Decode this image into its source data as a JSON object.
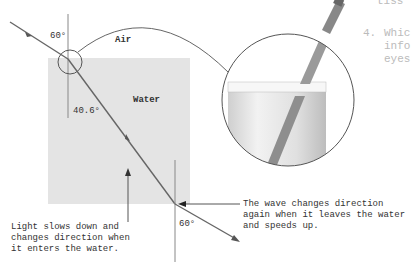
{
  "diagram": {
    "media": {
      "air_label": "Air",
      "water_label": "Water"
    },
    "angles": {
      "incident": "60°",
      "refracted": "40.6°",
      "exit": "60°"
    },
    "annotations": {
      "enter": "Light slows down and\nchanges direction when\nit enters the water.",
      "exit": "The wave changes direction\nagain when it leaves the water\nand speeds up."
    },
    "inset": {
      "description": "pencil-in-glass-of-water"
    },
    "colors": {
      "water_fill": "#e4e4e4",
      "ray": "#666666",
      "line": "#888888"
    }
  },
  "side_text": {
    "line0": "tiss",
    "q_number": "4.",
    "line1": "Whic",
    "line2": "info",
    "line3": "eyes"
  }
}
